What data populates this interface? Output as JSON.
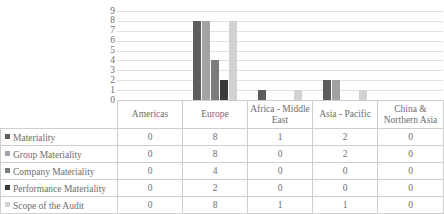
{
  "chart_data": {
    "type": "bar",
    "title": "",
    "xlabel": "",
    "ylabel": "",
    "ylim": [
      0,
      9
    ],
    "yticks": [
      "9",
      "8",
      "7",
      "6",
      "5",
      "4",
      "3",
      "2",
      "1",
      "0"
    ],
    "grid": true,
    "legend_position": "table-left",
    "categories": [
      "Americas",
      "Europe",
      "Africa - Middle East",
      "Asia - Pacific",
      "China & Northern Asia"
    ],
    "series": [
      {
        "name": "Materiality",
        "color": "#5d5d5d",
        "values": [
          0,
          8,
          1,
          2,
          0
        ]
      },
      {
        "name": "Group Materiality",
        "color": "#a3a3a3",
        "values": [
          0,
          8,
          0,
          2,
          0
        ]
      },
      {
        "name": "Company Materiality",
        "color": "#7b7b7b",
        "values": [
          0,
          4,
          0,
          0,
          0
        ]
      },
      {
        "name": "Performance Materiality",
        "color": "#3a3a3a",
        "values": [
          0,
          2,
          0,
          0,
          0
        ]
      },
      {
        "name": "Scope of the Audit",
        "color": "#d2d2d2",
        "values": [
          0,
          8,
          1,
          1,
          0
        ]
      }
    ]
  },
  "table": {
    "corner_label": "",
    "column_headers": [
      "Americas",
      "Europe",
      "Africa - Middle East",
      "Asia - Pacific",
      "China & Northern Asia"
    ],
    "rows": [
      {
        "label": "Materiality",
        "swatch": "#5d5d5d",
        "cells": [
          "0",
          "8",
          "1",
          "2",
          "0"
        ]
      },
      {
        "label": "Group Materiality",
        "swatch": "#a3a3a3",
        "cells": [
          "0",
          "8",
          "0",
          "2",
          "0"
        ]
      },
      {
        "label": "Company Materiality",
        "swatch": "#7b7b7b",
        "cells": [
          "0",
          "4",
          "0",
          "0",
          "0"
        ]
      },
      {
        "label": "Performance Materiality",
        "swatch": "#3a3a3a",
        "cells": [
          "0",
          "2",
          "0",
          "0",
          "0"
        ]
      },
      {
        "label": "Scope of the Audit",
        "swatch": "#d2d2d2",
        "cells": [
          "0",
          "8",
          "1",
          "1",
          "0"
        ]
      }
    ]
  },
  "style": {
    "gridline_color": "#e2e2e2",
    "border_color": "#cfcfcf",
    "text_color": "#6e6e6e"
  }
}
